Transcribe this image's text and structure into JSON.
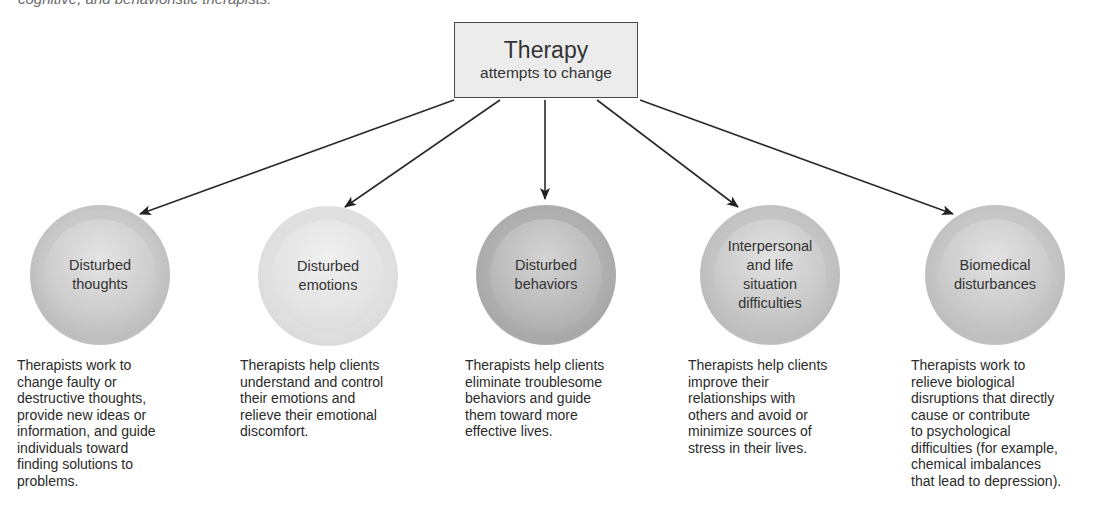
{
  "caption": "cognitive, and behavioristic therapists.",
  "root": {
    "title": "Therapy",
    "subtitle": "attempts to change"
  },
  "nodes": [
    {
      "label": "Disturbed\nthoughts",
      "description": "Therapists work to\nchange faulty or\ndestructive thoughts,\nprovide new ideas or\ninformation, and guide\nindividuals toward\nfinding solutions to\nproblems."
    },
    {
      "label": "Disturbed\nemotions",
      "description": "Therapists help clients\nunderstand and control\ntheir emotions and\nrelieve their emotional\ndiscomfort."
    },
    {
      "label": "Disturbed\nbehaviors",
      "description": "Therapists help clients\neliminate troublesome\nbehaviors and guide\nthem toward more\neffective lives."
    },
    {
      "label": "Interpersonal\nand life\nsituation\ndifficulties",
      "description": "Therapists help clients\nimprove their\nrelationships with\nothers and avoid or\nminimize sources of\nstress in their lives."
    },
    {
      "label": "Biomedical\ndisturbances",
      "description": "Therapists work to\nrelieve biological\ndisruptions that directly\ncause or contribute\nto psychological\ndifficulties (for example,\nchemical imbalances\nthat lead to depression)."
    }
  ],
  "colors": {
    "box_fill": "#ececec",
    "box_border": "#4a4a4a",
    "arrow": "#2a2a2a",
    "text": "#2a2a2a"
  }
}
